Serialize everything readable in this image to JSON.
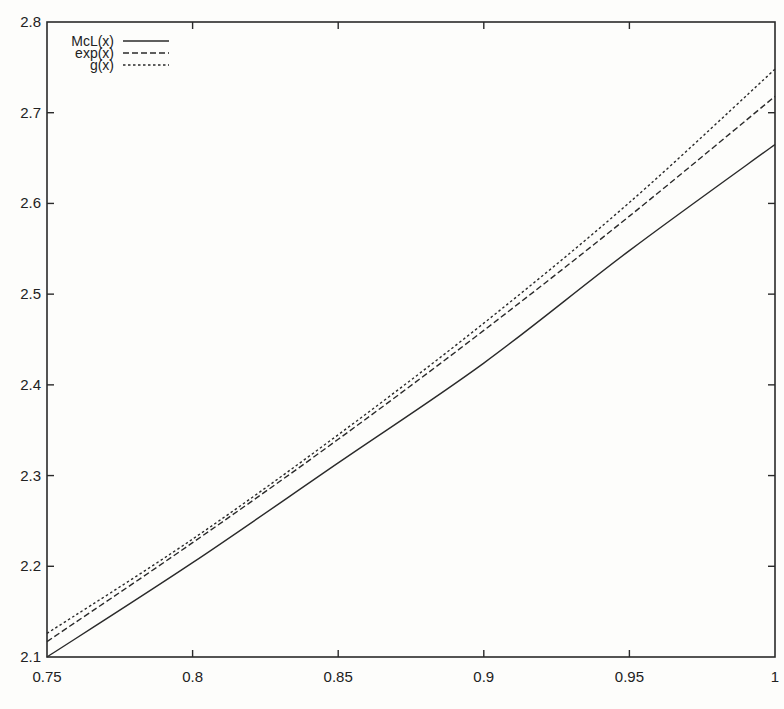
{
  "chart_data": {
    "type": "line",
    "title": "",
    "xlabel": "",
    "ylabel": "",
    "xlim": [
      0.75,
      1.0
    ],
    "ylim": [
      2.1,
      2.8
    ],
    "grid": false,
    "legend_position": "top-left",
    "x_ticks": [
      "0.75",
      "0.8",
      "0.85",
      "0.9",
      "0.95",
      "1"
    ],
    "x_tick_values": [
      0.75,
      0.8,
      0.85,
      0.9,
      0.95,
      1.0
    ],
    "y_ticks": [
      "2.1",
      "2.2",
      "2.3",
      "2.4",
      "2.5",
      "2.6",
      "2.7",
      "2.8"
    ],
    "y_tick_values": [
      2.1,
      2.2,
      2.3,
      2.4,
      2.5,
      2.6,
      2.7,
      2.8
    ],
    "x": [
      0.75,
      0.8,
      0.85,
      0.9,
      0.95,
      1.0
    ],
    "series": [
      {
        "name": "McL(x)",
        "style": "solid",
        "values": [
          2.1,
          2.204,
          2.314,
          2.424,
          2.548,
          2.665
        ]
      },
      {
        "name": "exp(x)",
        "style": "dashed",
        "values": [
          2.117,
          2.226,
          2.34,
          2.46,
          2.586,
          2.718
        ]
      },
      {
        "name": "g(x)",
        "style": "dotted",
        "values": [
          2.126,
          2.23,
          2.345,
          2.468,
          2.601,
          2.748
        ]
      }
    ]
  },
  "colors": {
    "line": "#2a2a2a",
    "axis": "#2a2a2a",
    "background": "#fdfdfb"
  }
}
